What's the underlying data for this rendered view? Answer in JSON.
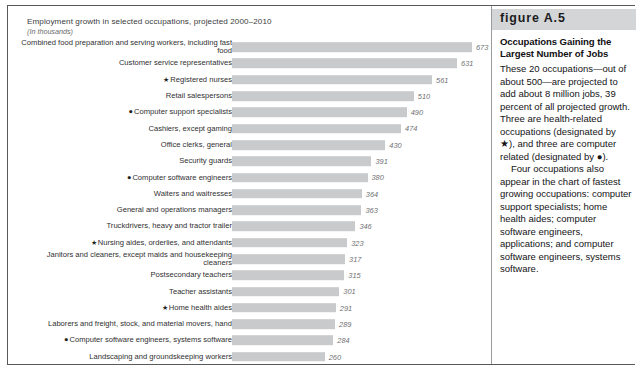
{
  "chart_data": {
    "type": "bar",
    "orientation": "horizontal",
    "title": "Employment growth in selected occupations, projected 2000–2010",
    "subtitle": "(In thousands)",
    "xlabel": "",
    "ylabel": "",
    "xlim": [
      0,
      700
    ],
    "grid": false,
    "legend": "none",
    "bar_color": "#c9cacb",
    "categories": [
      "Combined food preparation and serving workers, including fast food",
      "Customer service representatives",
      "Registered nurses",
      "Retail salespersons",
      "Computer support specialists",
      "Cashiers, except gaming",
      "Office clerks, general",
      "Security guards",
      "Computer software engineers",
      "Waiters and waitresses",
      "General and operations managers",
      "Truckdrivers, heavy and tractor trailer",
      "Nursing aides, orderlies, and attendants",
      "Janitors and cleaners, except maids and housekeeping cleaners",
      "Postsecondary teachers",
      "Teacher assistants",
      "Home health aides",
      "Laborers and freight, stock, and material movers, hand",
      "Computer software engineers, systems software",
      "Landscaping and groundskeeping workers"
    ],
    "values": [
      673,
      631,
      561,
      510,
      490,
      474,
      430,
      391,
      380,
      364,
      363,
      346,
      323,
      317,
      315,
      301,
      291,
      289,
      284,
      260
    ],
    "markers": [
      "",
      "",
      "star",
      "",
      "dot",
      "",
      "",
      "",
      "dot",
      "",
      "",
      "",
      "star",
      "",
      "",
      "",
      "star",
      "",
      "dot",
      ""
    ]
  },
  "rows": [
    {
      "label_line1": "Combined food preparation and serving workers,",
      "label_line2": "including fast food",
      "marker": "",
      "value": "673"
    },
    {
      "label_line1": "Customer service representatives",
      "label_line2": "",
      "marker": "",
      "value": "631"
    },
    {
      "label_line1": "Registered nurses",
      "label_line2": "",
      "marker": "★",
      "value": "561"
    },
    {
      "label_line1": "Retail salespersons",
      "label_line2": "",
      "marker": "",
      "value": "510"
    },
    {
      "label_line1": "Computer support specialists",
      "label_line2": "",
      "marker": "●",
      "value": "490"
    },
    {
      "label_line1": "Cashiers, except gaming",
      "label_line2": "",
      "marker": "",
      "value": "474"
    },
    {
      "label_line1": "Office clerks, general",
      "label_line2": "",
      "marker": "",
      "value": "430"
    },
    {
      "label_line1": "Security guards",
      "label_line2": "",
      "marker": "",
      "value": "391"
    },
    {
      "label_line1": "Computer software engineers",
      "label_line2": "",
      "marker": "●",
      "value": "380"
    },
    {
      "label_line1": "Waiters and waitresses",
      "label_line2": "",
      "marker": "",
      "value": "364"
    },
    {
      "label_line1": "General and operations managers",
      "label_line2": "",
      "marker": "",
      "value": "363"
    },
    {
      "label_line1": "Truckdrivers, heavy and tractor trailer",
      "label_line2": "",
      "marker": "",
      "value": "346"
    },
    {
      "label_line1": "Nursing aides, orderlies, and attendants",
      "label_line2": "",
      "marker": "★",
      "value": "323"
    },
    {
      "label_line1": "Janitors and cleaners, except maids and",
      "label_line2": "housekeeping cleaners",
      "marker": "",
      "value": "317"
    },
    {
      "label_line1": "Postsecondary teachers",
      "label_line2": "",
      "marker": "",
      "value": "315"
    },
    {
      "label_line1": "Teacher assistants",
      "label_line2": "",
      "marker": "",
      "value": "301"
    },
    {
      "label_line1": "Home health aides",
      "label_line2": "",
      "marker": "★",
      "value": "291"
    },
    {
      "label_line1": "Laborers and freight, stock, and material movers, hand",
      "label_line2": "",
      "marker": "",
      "value": "289"
    },
    {
      "label_line1": "Computer software engineers, systems software",
      "label_line2": "",
      "marker": "●",
      "value": "284"
    },
    {
      "label_line1": "Landscaping and groundskeeping workers",
      "label_line2": "",
      "marker": "",
      "value": "260"
    }
  ],
  "sidebar": {
    "figure_number": "figure A.5",
    "heading": "Occupations Gaining the Largest Number of Jobs",
    "paragraph1": "These 20 occupations—out of about 500—are projected to add about 8 million jobs, 39 percent of all projected growth. Three are health-related occupations (designated by ★), and three are computer related (designated by ●).",
    "paragraph2": "Four occupations also appear in the chart of fastest growing occupations: computer support specialists; home health aides; computer software engineers, applications; and computer software engineers, systems software."
  }
}
